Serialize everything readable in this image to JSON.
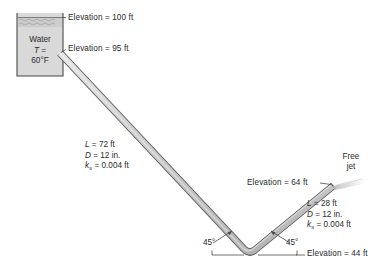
{
  "figure": {
    "type": "engineering-schematic",
    "background_color": "#ffffff",
    "line_color": "#3a3a3a",
    "pipe_fill": "#c9c9c9",
    "tank_fill": "#d8d8d8"
  },
  "tank": {
    "label_line1": "Water",
    "label_line2_symbol": "T",
    "label_line2_equals": "=",
    "label_line3": "60°F",
    "water_surface_pattern": "hatched-waves"
  },
  "elevations": [
    {
      "name": "water-surface",
      "text": "Elevation = 100 ft"
    },
    {
      "name": "pipe-inlet",
      "text": "Elevation = 95 ft"
    },
    {
      "name": "pipe-outlet",
      "text": "Elevation = 64 ft"
    },
    {
      "name": "elbow-bottom",
      "text": "Elevation = 44 ft"
    }
  ],
  "pipe_segments": [
    {
      "name": "upper-sloping-pipe",
      "length": "L = 72 ft",
      "length_symbol": "L",
      "length_value": "= 72 ft",
      "diameter": "D = 12 in.",
      "diameter_symbol": "D",
      "diameter_value": "= 12 in.",
      "roughness_symbol": "k",
      "roughness_sub": "s",
      "roughness_value": "= 0.004 ft"
    },
    {
      "name": "lower-rising-pipe",
      "length": "L = 28 ft",
      "length_symbol": "L",
      "length_value": "= 28 ft",
      "diameter": "D = 12 in.",
      "diameter_symbol": "D",
      "diameter_value": "= 12 in.",
      "roughness_symbol": "k",
      "roughness_sub": "s",
      "roughness_value": "= 0.004 ft"
    }
  ],
  "angles": [
    {
      "name": "left-elbow-angle",
      "text": "45°"
    },
    {
      "name": "right-elbow-angle",
      "text": "45°"
    }
  ],
  "outlet": {
    "free_jet_line1": "Free",
    "free_jet_line2": "jet"
  }
}
